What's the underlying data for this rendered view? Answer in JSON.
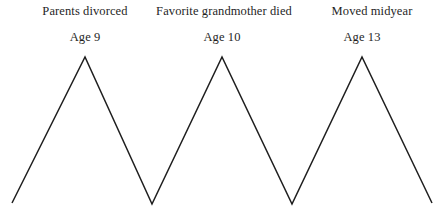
{
  "figure": {
    "type": "zigzag-timeline-diagram",
    "background_color": "#ffffff",
    "line_color": "#1f1f1f",
    "line_width": 1.5,
    "width": 445,
    "height": 216
  },
  "events": [
    {
      "event_label": "Parents divorced",
      "age_label": "Age 9",
      "peak_x": 85,
      "peak_y": 57,
      "label_x": 85,
      "label_top": 4,
      "age_top": 30
    },
    {
      "event_label": "Favorite grandmother died",
      "age_label": "Age 10",
      "peak_x": 222,
      "peak_y": 57,
      "label_x": 224,
      "label_top": 4,
      "age_top": 30
    },
    {
      "event_label": "Moved midyear",
      "age_label": "Age 13",
      "peak_x": 362,
      "peak_y": 57,
      "label_x": 372,
      "label_top": 4,
      "age_top": 30
    }
  ],
  "chart_data": {
    "type": "line",
    "title": "",
    "xlabel": "",
    "ylabel": "",
    "grid": false,
    "legend": "none",
    "annotations": [
      "Parents divorced",
      "Age 9",
      "Favorite grandmother died",
      "Age 10",
      "Moved midyear",
      "Age 13"
    ],
    "points": [
      {
        "x": 12,
        "y": 203
      },
      {
        "x": 85,
        "y": 57
      },
      {
        "x": 152,
        "y": 204
      },
      {
        "x": 222,
        "y": 57
      },
      {
        "x": 292,
        "y": 204
      },
      {
        "x": 362,
        "y": 57
      },
      {
        "x": 432,
        "y": 203
      }
    ],
    "polyline": "12,203 85,57 152,204 222,57 292,204 362,57 432,203",
    "xlim": [
      0,
      445
    ],
    "ylim": [
      216,
      0
    ]
  }
}
